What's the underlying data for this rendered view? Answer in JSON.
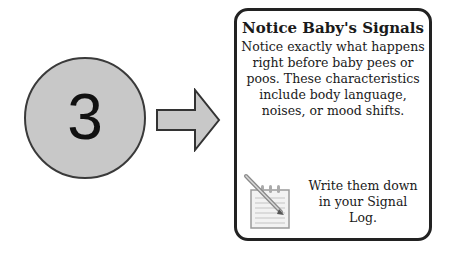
{
  "step": {
    "number": "3",
    "circle_fill": "#c8c8c8",
    "arrow_fill": "#c8c8c8",
    "icon": "arrow-right-icon"
  },
  "card": {
    "title": "Notice Baby's Signals",
    "body": "Notice exactly what happens right before baby pees or poos. These characteristics include body language, noises, or mood shifts.",
    "footer_icon": "notepad-pencil-icon",
    "footer_text": "Write them down in your Signal Log."
  }
}
